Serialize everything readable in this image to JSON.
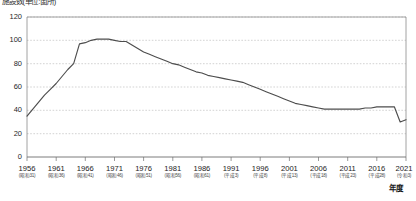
{
  "chart_data": {
    "type": "line",
    "title": "施設数(単位:箇所)",
    "xlabel": "年度",
    "ylabel": "",
    "ylim": [
      0,
      120
    ],
    "ytick_values": [
      0,
      20,
      40,
      60,
      80,
      100,
      120
    ],
    "ytick_labels": [
      "0",
      "20",
      "40",
      "60",
      "80",
      "100",
      "120"
    ],
    "xlim": [
      1956,
      2021
    ],
    "grid": true,
    "grid_style": "dotted-horizontal",
    "legend": "none",
    "line_color": "#4d4d4d",
    "xtick_labels": [
      {
        "year": "1956",
        "era": "(昭和31)"
      },
      {
        "year": "1961",
        "era": "(昭和36)"
      },
      {
        "year": "1966",
        "era": "(昭和41)"
      },
      {
        "year": "1971",
        "era": "(昭和46)"
      },
      {
        "year": "1976",
        "era": "(昭和51)"
      },
      {
        "year": "1981",
        "era": "(昭和56)"
      },
      {
        "year": "1986",
        "era": "(昭和61)"
      },
      {
        "year": "1991",
        "era": "(平成3)"
      },
      {
        "year": "1996",
        "era": "(平成8)"
      },
      {
        "year": "2001",
        "era": "(平成13)"
      },
      {
        "year": "2006",
        "era": "(平成18)"
      },
      {
        "year": "2011",
        "era": "(平成23)"
      },
      {
        "year": "2016",
        "era": "(平成28)"
      },
      {
        "year": "2021",
        "era": "(令和3)"
      }
    ],
    "x": [
      1956,
      1957,
      1958,
      1959,
      1960,
      1961,
      1962,
      1963,
      1964,
      1965,
      1966,
      1967,
      1968,
      1969,
      1970,
      1971,
      1972,
      1973,
      1974,
      1975,
      1976,
      1977,
      1978,
      1979,
      1980,
      1981,
      1982,
      1983,
      1984,
      1985,
      1986,
      1987,
      1988,
      1989,
      1990,
      1991,
      1992,
      1993,
      1994,
      1995,
      1996,
      1997,
      1998,
      1999,
      2000,
      2001,
      2002,
      2003,
      2004,
      2005,
      2006,
      2007,
      2008,
      2009,
      2010,
      2011,
      2012,
      2013,
      2014,
      2015,
      2016,
      2017,
      2018,
      2019,
      2020,
      2021
    ],
    "series": [
      {
        "name": "施設数",
        "values": [
          35,
          41,
          47,
          53,
          58,
          63,
          69,
          75,
          80,
          97,
          98,
          100,
          101,
          101,
          101,
          100,
          99,
          99,
          96,
          93,
          90,
          88,
          86,
          84,
          82,
          80,
          79,
          77,
          75,
          73,
          72,
          70,
          69,
          68,
          67,
          66,
          65,
          64,
          62,
          60,
          58,
          56,
          54,
          52,
          50,
          48,
          46,
          45,
          44,
          43,
          42,
          41,
          41,
          41,
          41,
          41,
          41,
          41,
          42,
          42,
          43,
          43,
          43,
          43,
          30,
          32
        ]
      }
    ]
  }
}
